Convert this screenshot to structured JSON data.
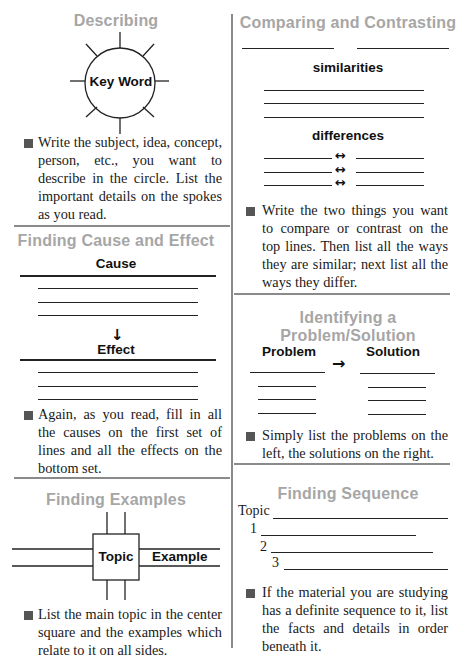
{
  "describing": {
    "title": "Describing",
    "center_label": "Key Word",
    "instruction": "Write the subject, idea, concept, person, etc., you want to describe in the circle. List the important details on the spokes as you read."
  },
  "comparing": {
    "title": "Comparing and Contrasting",
    "similarities_label": "similarities",
    "differences_label": "differences",
    "arrow_glyph": "↔",
    "instruction": "Write the two things you want to compare or contrast on the top lines. Then list all the ways they are similar; next list all the ways they differ."
  },
  "cause_effect": {
    "title": "Finding Cause and Effect",
    "cause_label": "Cause",
    "effect_label": "Effect",
    "arrow_glyph": "↓",
    "instruction": "Again, as you read, fill in all the causes on the first set of lines and all the effects on the bottom set."
  },
  "problem_solution": {
    "title_line1": "Identifying a",
    "title_line2": "Problem/Solution",
    "problem_label": "Problem",
    "solution_label": "Solution",
    "arrow_glyph": "→",
    "instruction": "Simply list the problems on the left, the solutions on the right."
  },
  "examples": {
    "title": "Finding Examples",
    "topic_label": "Topic",
    "example_label": "Example",
    "instruction": "List the main topic in the center square and the examples which relate to it on all sides."
  },
  "sequence": {
    "title": "Finding Sequence",
    "topic_label": "Topic",
    "steps": [
      "1",
      "2",
      "3"
    ],
    "instruction": "If the material you are studying has a definite sequence to it, list the facts and details in order beneath it."
  }
}
